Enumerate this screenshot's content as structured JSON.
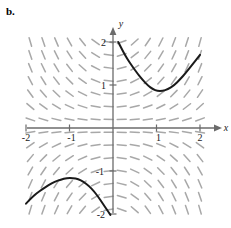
{
  "panel": {
    "label": "b."
  },
  "chart_data": {
    "type": "line",
    "title": "",
    "subtitle": "",
    "xlabel": "x",
    "ylabel": "y",
    "xlim": [
      -2,
      2
    ],
    "ylim": [
      -2,
      2
    ],
    "grid": false,
    "legend": null,
    "x_ticks": [
      -2,
      -1,
      1,
      2
    ],
    "y_ticks": [
      2,
      1,
      -1,
      -2
    ],
    "x_tick_labels": [
      "-2",
      "-1",
      "1",
      "2"
    ],
    "y_tick_labels": [
      "2",
      "1",
      "-1",
      "-2"
    ],
    "plot_kind": "slope-field-with-solution-curves",
    "slope_field": {
      "description": "direction field of a first-order ODE, short gray tick segments on a grid",
      "color": "#9a9a9a",
      "x_samples": [
        -1.9,
        -1.6,
        -1.3,
        -1.0,
        -0.7,
        -0.4,
        -0.1,
        0.2,
        0.5,
        0.8,
        1.1,
        1.4,
        1.7,
        2.0
      ],
      "y_samples": [
        2.0,
        1.7,
        1.4,
        1.1,
        0.8,
        0.5,
        0.2,
        -0.1,
        -0.4,
        -0.7,
        -1.0,
        -1.3,
        -1.6,
        -1.9
      ],
      "slope_rule": "dy/dx = x*y/1.1",
      "segment_length_px": 9
    },
    "series": [
      {
        "name": "upper-right solution curve",
        "color": "#1a1a1a",
        "width_px": 2,
        "points": [
          [
            0.12,
            2.0
          ],
          [
            0.22,
            1.8
          ],
          [
            0.32,
            1.62
          ],
          [
            0.44,
            1.44
          ],
          [
            0.56,
            1.27
          ],
          [
            0.68,
            1.12
          ],
          [
            0.8,
            0.99
          ],
          [
            0.92,
            0.9
          ],
          [
            1.02,
            0.86
          ],
          [
            1.14,
            0.86
          ],
          [
            1.26,
            0.9
          ],
          [
            1.4,
            0.99
          ],
          [
            1.54,
            1.13
          ],
          [
            1.68,
            1.29
          ],
          [
            1.82,
            1.47
          ],
          [
            2.0,
            1.7
          ]
        ]
      },
      {
        "name": "lower-left solution curve",
        "color": "#1a1a1a",
        "width_px": 2,
        "points": [
          [
            -2.0,
            -1.76
          ],
          [
            -1.88,
            -1.63
          ],
          [
            -1.76,
            -1.52
          ],
          [
            -1.62,
            -1.42
          ],
          [
            -1.48,
            -1.33
          ],
          [
            -1.34,
            -1.25
          ],
          [
            -1.2,
            -1.2
          ],
          [
            -1.06,
            -1.16
          ],
          [
            -0.92,
            -1.16
          ],
          [
            -0.8,
            -1.19
          ],
          [
            -0.68,
            -1.25
          ],
          [
            -0.56,
            -1.34
          ],
          [
            -0.44,
            -1.47
          ],
          [
            -0.34,
            -1.6
          ],
          [
            -0.24,
            -1.75
          ],
          [
            -0.14,
            -1.9
          ],
          [
            -0.06,
            -2.02
          ]
        ]
      }
    ]
  },
  "colors": {
    "axis": "#6b6b6b",
    "curve": "#1a1a1a",
    "field": "#9a9a9a",
    "text": "#1a1a1a",
    "background": "#ffffff"
  }
}
